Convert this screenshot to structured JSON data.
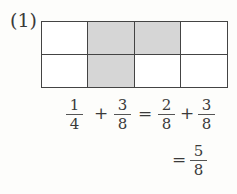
{
  "problem_label": "(1)",
  "grid": {
    "rows": 2,
    "cols": 4,
    "shaded": [
      [
        0,
        1
      ],
      [
        0,
        2
      ],
      [
        1,
        1
      ]
    ]
  },
  "equation": {
    "line1": {
      "f1": {
        "num": "1",
        "den": "4"
      },
      "op1": "+",
      "f2": {
        "num": "3",
        "den": "8"
      },
      "eq": "=",
      "f3": {
        "num": "2",
        "den": "8"
      },
      "op2": "+",
      "f4": {
        "num": "3",
        "den": "8"
      }
    },
    "line2": {
      "eq": "=",
      "result": {
        "num": "5",
        "den": "8"
      }
    }
  }
}
